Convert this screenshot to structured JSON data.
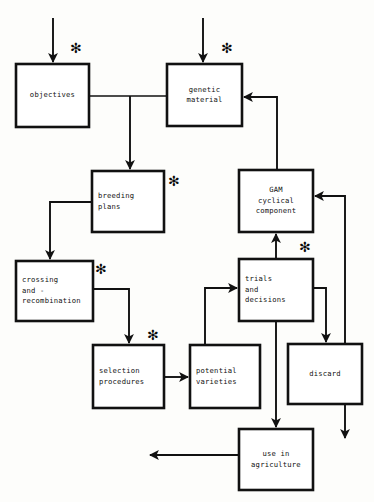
{
  "diagram": {
    "background_color": "#fdfdfb",
    "line_color": "#111111",
    "box_fill": "#ffffff",
    "marker_symbol": "✻",
    "nodes": [
      {
        "id": "objectives",
        "label": "objectives",
        "lines": [
          "objectives"
        ],
        "x": 16,
        "y": 64,
        "w": 73,
        "h": 63,
        "marker": true,
        "align": "center"
      },
      {
        "id": "genetic",
        "label": "genetic material",
        "lines": [
          "genetic",
          "material"
        ],
        "x": 167,
        "y": 64,
        "w": 75,
        "h": 62,
        "marker": true,
        "align": "center"
      },
      {
        "id": "breeding",
        "label": "breeding plans",
        "lines": [
          "breeding",
          "plans"
        ],
        "x": 92,
        "y": 171,
        "w": 72,
        "h": 61,
        "marker": true,
        "align": "left"
      },
      {
        "id": "gam",
        "label": "GAM cyclical component",
        "lines": [
          "GAM",
          "cyclical",
          "component"
        ],
        "x": 239,
        "y": 170,
        "w": 74,
        "h": 62,
        "marker": false,
        "align": "center"
      },
      {
        "id": "crossing",
        "label": "crossing and - recombination",
        "lines": [
          "crossing",
          "and -",
          "recombination"
        ],
        "x": 16,
        "y": 261,
        "w": 77,
        "h": 60,
        "marker": true,
        "align": "left"
      },
      {
        "id": "trials",
        "label": "trials and decisions",
        "lines": [
          "trials",
          "and",
          "decisions"
        ],
        "x": 239,
        "y": 259,
        "w": 74,
        "h": 62,
        "marker": true,
        "align": "left"
      },
      {
        "id": "selection",
        "label": "selection procedures",
        "lines": [
          "selection",
          "procedures"
        ],
        "x": 93,
        "y": 345,
        "w": 71,
        "h": 63,
        "marker": true,
        "align": "left"
      },
      {
        "id": "potential",
        "label": "potential varieties",
        "lines": [
          "potential",
          "varieties"
        ],
        "x": 190,
        "y": 345,
        "w": 70,
        "h": 63,
        "marker": false,
        "align": "left"
      },
      {
        "id": "discard",
        "label": "discard",
        "lines": [
          "discard"
        ],
        "x": 288,
        "y": 344,
        "w": 74,
        "h": 60,
        "marker": false,
        "align": "center"
      },
      {
        "id": "use",
        "label": "use in agriculture",
        "lines": [
          "use in",
          "agriculture"
        ],
        "x": 239,
        "y": 429,
        "w": 74,
        "h": 61,
        "marker": false,
        "align": "center"
      }
    ],
    "markers": [
      {
        "for": "objectives",
        "x": 70,
        "y": 41
      },
      {
        "for": "genetic",
        "x": 221,
        "y": 41
      },
      {
        "for": "breeding",
        "x": 168,
        "y": 174
      },
      {
        "for": "crossing",
        "x": 95,
        "y": 262
      },
      {
        "for": "trials",
        "x": 299,
        "y": 240
      },
      {
        "for": "selection",
        "x": 147,
        "y": 328
      }
    ],
    "edges": [
      {
        "id": "in-objectives",
        "from": "external",
        "to": "objectives",
        "desc": "arrow down into objectives top"
      },
      {
        "id": "in-genetic",
        "from": "external",
        "to": "genetic",
        "desc": "arrow down into genetic material top"
      },
      {
        "id": "objectives-genetic",
        "from": "objectives",
        "to": "genetic",
        "desc": "objectives right to genetic material left"
      },
      {
        "id": "objectives-breeding",
        "from": "objectives",
        "to": "breeding",
        "desc": "branch down into breeding plans top"
      },
      {
        "id": "breeding-crossing",
        "from": "breeding",
        "to": "crossing",
        "desc": "breeding plans left, down into crossing top"
      },
      {
        "id": "crossing-selection",
        "from": "crossing",
        "to": "selection",
        "desc": "crossing right, down into selection procedures top"
      },
      {
        "id": "selection-potential",
        "from": "selection",
        "to": "potential",
        "desc": "selection procedures right to potential varieties left"
      },
      {
        "id": "potential-trials",
        "from": "potential",
        "to": "trials",
        "desc": "potential varieties top, up and right into trials left"
      },
      {
        "id": "trials-gam",
        "from": "trials",
        "to": "gam",
        "desc": "trials top arrow up into GAM bottom"
      },
      {
        "id": "gam-genetic",
        "from": "gam",
        "to": "genetic",
        "desc": "GAM top up and left into genetic material right"
      },
      {
        "id": "trials-discard",
        "from": "trials",
        "to": "discard",
        "desc": "trials right, down into discard top"
      },
      {
        "id": "trials-use",
        "from": "trials",
        "to": "use",
        "desc": "trials bottom down into use in agriculture top"
      },
      {
        "id": "discard-out",
        "from": "discard",
        "to": "external",
        "desc": "discard bottom arrow down"
      },
      {
        "id": "feedback-gam",
        "from": "discard",
        "to": "gam",
        "desc": "right vertical feedback line into GAM right"
      },
      {
        "id": "use-out",
        "from": "use",
        "to": "external",
        "desc": "use in agriculture left arrow out"
      }
    ]
  }
}
